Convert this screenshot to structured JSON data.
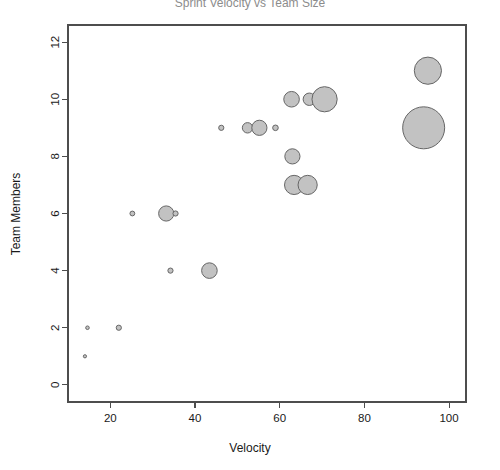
{
  "chart_data": {
    "type": "scatter",
    "title": "Sprint Velocity vs Team Size",
    "xlabel": "Velocity",
    "ylabel": "Team Members",
    "xlim": [
      10,
      104
    ],
    "ylim": [
      -0.6,
      12.6
    ],
    "xticks": [
      20,
      40,
      60,
      80,
      100
    ],
    "yticks": [
      0,
      2,
      4,
      6,
      8,
      10,
      12
    ],
    "grid": false,
    "legend": false,
    "bubble_fill": "#c2c2c2",
    "bubble_stroke": "#666666",
    "axis_color": "#4d4d4d",
    "background": "#ffffff",
    "size_encoding": "radius",
    "points": [
      {
        "x": 14.0,
        "y": 1.0,
        "r": 1.6
      },
      {
        "x": 14.6,
        "y": 2.0,
        "r": 1.8
      },
      {
        "x": 22.0,
        "y": 2.0,
        "r": 2.6
      },
      {
        "x": 25.2,
        "y": 6.0,
        "r": 2.4
      },
      {
        "x": 33.2,
        "y": 6.0,
        "r": 7.6
      },
      {
        "x": 35.4,
        "y": 6.0,
        "r": 2.6
      },
      {
        "x": 34.2,
        "y": 4.0,
        "r": 2.6
      },
      {
        "x": 43.4,
        "y": 4.0,
        "r": 7.8
      },
      {
        "x": 46.2,
        "y": 9.0,
        "r": 2.6
      },
      {
        "x": 52.4,
        "y": 9.0,
        "r": 5.2
      },
      {
        "x": 55.2,
        "y": 9.0,
        "r": 7.6
      },
      {
        "x": 59.0,
        "y": 9.0,
        "r": 2.8
      },
      {
        "x": 62.8,
        "y": 10.0,
        "r": 7.8
      },
      {
        "x": 67.0,
        "y": 10.0,
        "r": 6.2
      },
      {
        "x": 70.6,
        "y": 10.0,
        "r": 12.6
      },
      {
        "x": 63.0,
        "y": 8.0,
        "r": 7.6
      },
      {
        "x": 63.4,
        "y": 7.0,
        "r": 9.6
      },
      {
        "x": 66.6,
        "y": 7.0,
        "r": 9.6
      },
      {
        "x": 95.0,
        "y": 11.0,
        "r": 13.6
      },
      {
        "x": 94.0,
        "y": 9.0,
        "r": 21.0
      }
    ]
  },
  "axes": {
    "y_tick_labels": [
      "0",
      "2",
      "4",
      "6",
      "8",
      "10",
      "12"
    ],
    "x_tick_labels": [
      "20",
      "40",
      "60",
      "80",
      "100"
    ]
  }
}
